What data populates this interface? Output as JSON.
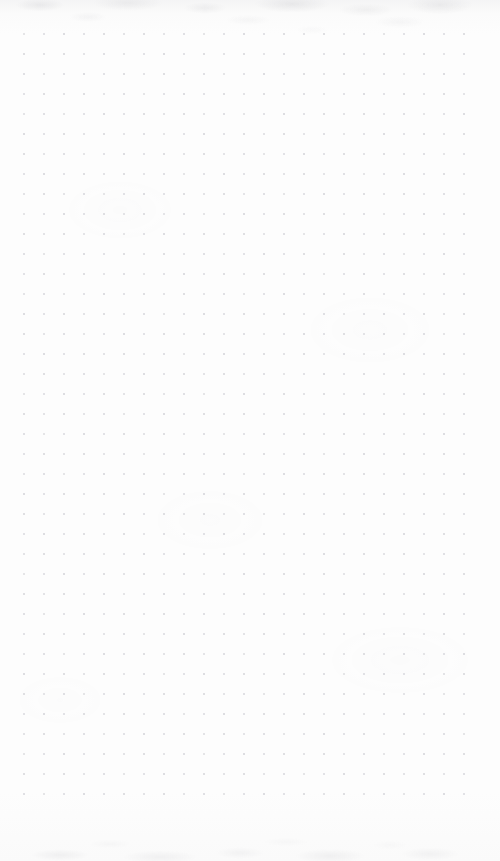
{
  "document": {
    "type": "dot-grid-paper",
    "title": "Blank dot grid notebook page",
    "page_width": 500,
    "page_height": 861,
    "background_color": "#fdfdfd",
    "content_text": "",
    "annotations": []
  },
  "grid": {
    "dot_color": "#d5d5da",
    "dot_diameter_px": 1.6,
    "spacing_px": 20,
    "origin_x": 24,
    "origin_y": 34,
    "columns": 23,
    "rows": 39,
    "margin_left_px": 24,
    "margin_right_px": 26,
    "margin_top_px": 34,
    "margin_bottom_px": 66
  },
  "texture": {
    "edge_grain_color": "#96969e",
    "top_band_height_px": 46,
    "bottom_band_height_px": 50
  }
}
